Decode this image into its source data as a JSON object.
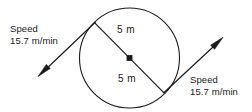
{
  "diagram": {
    "background_color": "#ffffff",
    "stroke_color": "#1a1a1a",
    "circle": {
      "center_x": 129.5,
      "center_y": 58,
      "radius": 50,
      "center_marker": "square-dot"
    },
    "labels": {
      "speed_left": {
        "line1": "Speed",
        "line2": "15.7 m/min"
      },
      "speed_right": {
        "line1": "Speed",
        "line2": "15.7 m/min"
      },
      "radius_upper": "5 m",
      "radius_lower": "5 m"
    },
    "arrows": {
      "left_arrow": {
        "direction": "down-left",
        "tip_x": 38,
        "tip_y": 76
      },
      "right_arrow": {
        "direction": "up-right",
        "tip_x": 223,
        "tip_y": 37
      }
    }
  }
}
